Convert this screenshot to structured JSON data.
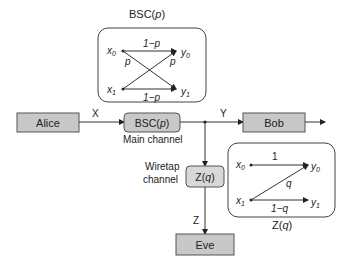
{
  "bsc_detail": {
    "title": "BSC(",
    "title_var": "p",
    "inputs": [
      "x0",
      "x1"
    ],
    "outputs": [
      "y0",
      "y1"
    ],
    "top_label": "1−p",
    "bottom_label": "1−p",
    "cross_left": "p",
    "cross_right": "p"
  },
  "alice": {
    "label": "Alice"
  },
  "x_signal": "X",
  "main_channel": {
    "label_prefix": "BSC(",
    "label_var": "p",
    "caption": "Main channel"
  },
  "y_signal": "Y",
  "bob": {
    "label": "Bob"
  },
  "wiretap": {
    "caption_line1": "Wiretap",
    "caption_line2": "channel",
    "label_prefix": "Z(",
    "label_var": "q"
  },
  "z_signal": "Z",
  "eve": {
    "label": "Eve"
  },
  "z_detail": {
    "title_prefix": "Z(",
    "title_var": "q",
    "top_label": "1",
    "cross_label": "q",
    "bottom_label": "1−q"
  },
  "colors": {
    "box_fill": "#c8c8c8",
    "box_stroke": "#555555",
    "line": "#333333"
  }
}
